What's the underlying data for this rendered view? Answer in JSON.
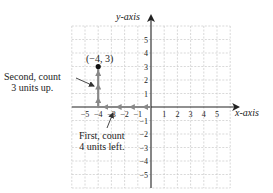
{
  "axes": {
    "x_label": "x-axis",
    "y_label": "y-axis",
    "x_ticks": [
      "-5",
      "-4",
      "-3",
      "-2",
      "-1",
      "1",
      "2",
      "3",
      "4",
      "5"
    ],
    "x_tick_values": [
      -5,
      -4,
      -3,
      -2,
      -1,
      1,
      2,
      3,
      4,
      5
    ],
    "y_ticks": [
      "5",
      "4",
      "3",
      "2",
      "1",
      "-1",
      "-2",
      "-3",
      "-4",
      "-5"
    ],
    "y_tick_values": [
      5,
      4,
      3,
      2,
      1,
      -1,
      -2,
      -3,
      -4,
      -5
    ],
    "grid_range": [
      -6,
      6
    ]
  },
  "point": {
    "label": "(−4, 3)",
    "x": -4,
    "y": 3
  },
  "annotations": {
    "second_step": {
      "line1": "Second, count",
      "line2": "3 units up."
    },
    "first_step": {
      "line1": "First, count",
      "line2": "4 units left."
    }
  },
  "colors": {
    "grid": "#c8c8c8",
    "axis": "#222222",
    "path_arrows": "#888888",
    "point": "#111111"
  }
}
